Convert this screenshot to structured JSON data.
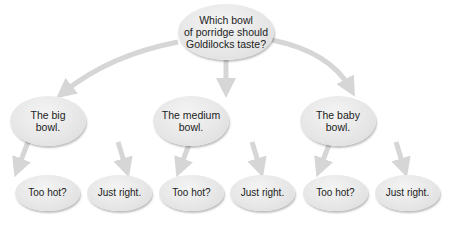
{
  "diagram": {
    "type": "decision-tree",
    "arrow_color": "#d6d6d6",
    "node_fill": "#e6e6e6",
    "root": {
      "id": "root",
      "lines": [
        "Which bowl",
        "of porridge should",
        "Goldilocks taste?"
      ]
    },
    "level1": [
      {
        "id": "mid-0",
        "lines": [
          "The big",
          "bowl."
        ]
      },
      {
        "id": "mid-1",
        "lines": [
          "The medium",
          "bowl."
        ]
      },
      {
        "id": "mid-2",
        "lines": [
          "The baby",
          "bowl."
        ]
      }
    ],
    "level2": [
      {
        "id": "leaf-0",
        "parent": "mid-0",
        "label": "Too hot?"
      },
      {
        "id": "leaf-1",
        "parent": "mid-0",
        "label": "Just right."
      },
      {
        "id": "leaf-2",
        "parent": "mid-1",
        "label": "Too hot?"
      },
      {
        "id": "leaf-3",
        "parent": "mid-1",
        "label": "Just right."
      },
      {
        "id": "leaf-4",
        "parent": "mid-2",
        "label": "Too hot?"
      },
      {
        "id": "leaf-5",
        "parent": "mid-2",
        "label": "Just right."
      }
    ],
    "edges": [
      {
        "from": "root",
        "to": "mid-0"
      },
      {
        "from": "root",
        "to": "mid-1"
      },
      {
        "from": "root",
        "to": "mid-2"
      },
      {
        "from": "mid-0",
        "to": "leaf-0"
      },
      {
        "from": "mid-0",
        "to": "leaf-1"
      },
      {
        "from": "mid-1",
        "to": "leaf-2"
      },
      {
        "from": "mid-1",
        "to": "leaf-3"
      },
      {
        "from": "mid-2",
        "to": "leaf-4"
      },
      {
        "from": "mid-2",
        "to": "leaf-5"
      }
    ]
  }
}
